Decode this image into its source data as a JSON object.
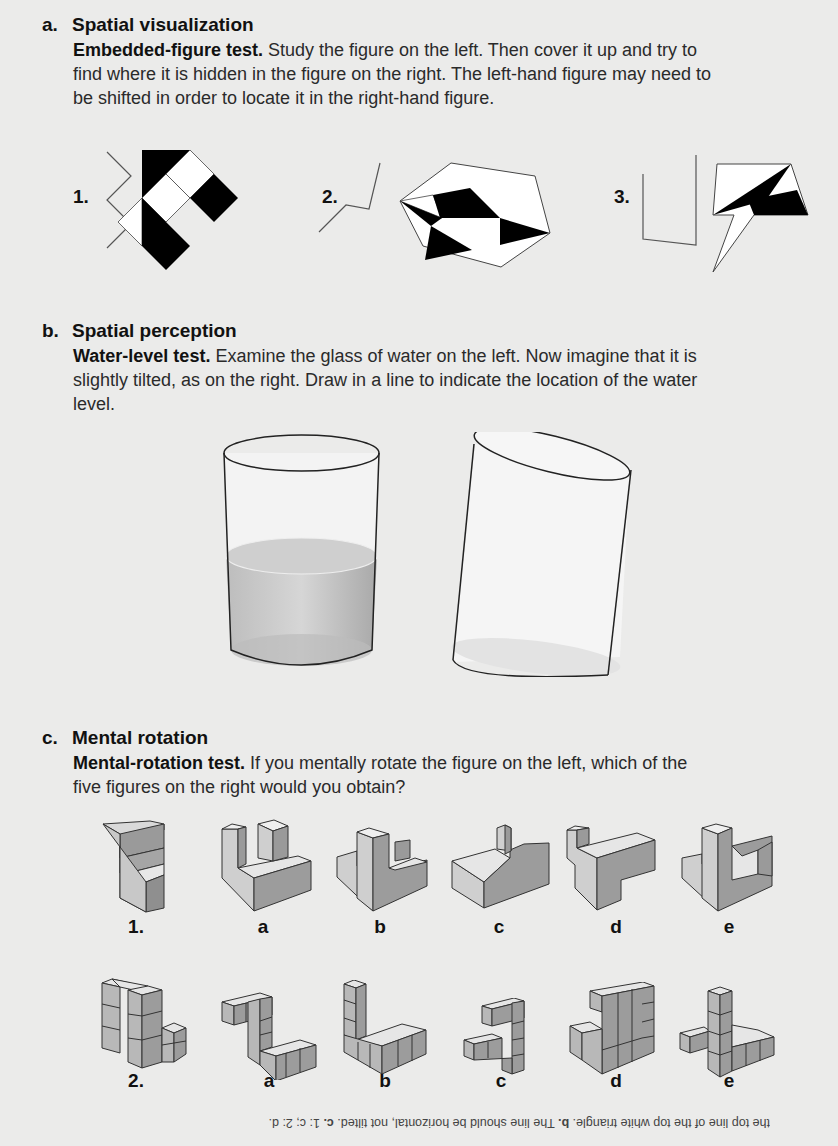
{
  "section_a": {
    "letter": "a.",
    "title": "Spatial visualization",
    "test_name": "Embedded-figure test.",
    "instructions": " Study the figure on the left. Then cover it up and try to find where it is hidden in the figure on the right. The left-hand figure may need to be shifted in order to locate it in the right-hand figure.",
    "items": [
      {
        "label": "1."
      },
      {
        "label": "2."
      },
      {
        "label": "3."
      }
    ]
  },
  "section_b": {
    "letter": "b.",
    "title": "Spatial perception",
    "test_name": "Water-level test.",
    "instructions": " Examine the glass of water on the left. Now imagine that it is slightly tilted, as on the right. Draw in a line to indicate the location of the water level."
  },
  "section_c": {
    "letter": "c.",
    "title": "Mental rotation",
    "test_name": "Mental-rotation test.",
    "instructions": " If you mentally rotate the figure on the left, which of the five figures on the right would you obtain?",
    "row1_labels": [
      "1.",
      "a",
      "b",
      "c",
      "d",
      "e"
    ],
    "row2_labels": [
      "2.",
      "a",
      "b",
      "c",
      "d",
      "e"
    ]
  },
  "answers": {
    "a_text": "the top line of the top white triangle. ",
    "b_label": "b.",
    "b_text": " The line should be horizontal, not tilted. ",
    "c_label": "c.",
    "c_text": " 1: c; 2: d."
  }
}
